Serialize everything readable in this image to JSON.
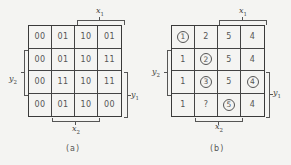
{
  "panels": [
    {
      "id": "a",
      "caption": "(a)",
      "cells": [
        [
          "00",
          "01",
          "10",
          "01"
        ],
        [
          "00",
          "01",
          "10",
          "11"
        ],
        [
          "00",
          "11",
          "10",
          "11"
        ],
        [
          "00",
          "01",
          "10",
          "00"
        ]
      ],
      "circled": [],
      "labels": {
        "x1": "x",
        "x1_sub": "1",
        "x2": "x",
        "x2_sub": "2",
        "y1": "y",
        "y1_sub": "1",
        "y2": "y",
        "y2_sub": "2"
      }
    },
    {
      "id": "b",
      "caption": "(b)",
      "cells": [
        [
          "1",
          "2",
          "5",
          "4"
        ],
        [
          "1",
          "2",
          "5",
          "4"
        ],
        [
          "1",
          "3",
          "5",
          "4"
        ],
        [
          "1",
          "?",
          "5",
          "4"
        ]
      ],
      "circled": [
        [
          0,
          0
        ],
        [
          1,
          1
        ],
        [
          2,
          1
        ],
        [
          2,
          3
        ],
        [
          3,
          2
        ]
      ],
      "labels": {
        "x1": "x",
        "x1_sub": "1",
        "x2": "x",
        "x2_sub": "2",
        "y1": "y",
        "y1_sub": "1",
        "y2": "y",
        "y2_sub": "2"
      }
    }
  ]
}
